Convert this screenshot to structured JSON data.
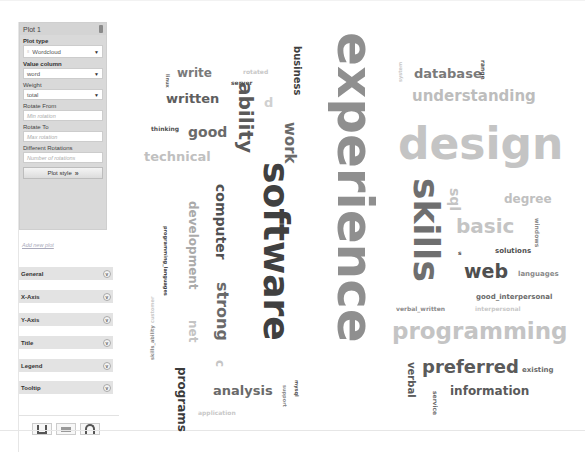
{
  "sidebar": {
    "plot_panel": {
      "title": "Plot 1",
      "plot_type_label": "Plot type",
      "plot_type_value": "Wordcloud",
      "value_column_label": "Value column",
      "value_column_value": "word",
      "weight_label": "Weight",
      "weight_value": "total",
      "rotate_from_label": "Rotate From",
      "rotate_from_placeholder": "Min rotation",
      "rotate_to_label": "Rotate To",
      "rotate_to_placeholder": "Max rotation",
      "different_rotations_label": "Different Rotations",
      "different_rotations_placeholder": "Number of rotations",
      "plot_style_label": "Plot style"
    },
    "add_plot_label": "Add new plot",
    "sections": [
      {
        "label": "General"
      },
      {
        "label": "X-Axis"
      },
      {
        "label": "Y-Axis"
      },
      {
        "label": "Title"
      },
      {
        "label": "Legend"
      },
      {
        "label": "Tooltip"
      }
    ],
    "toolbar": {
      "save_icon": "save-icon",
      "csv_icon": "csv-icon",
      "refresh_icon": "refresh-icon"
    }
  },
  "chart_data": {
    "type": "wordcloud",
    "title": "",
    "words": [
      {
        "text": "experience",
        "x": 200,
        "y": 22,
        "size": 50,
        "color": "#8f8f8f",
        "rot": 90
      },
      {
        "text": "software",
        "x": 128,
        "y": 152,
        "size": 36,
        "color": "#404040",
        "rot": 90
      },
      {
        "text": "design",
        "x": 268,
        "y": 112,
        "size": 44,
        "color": "#c4c4c4",
        "rot": 0
      },
      {
        "text": "skills",
        "x": 278,
        "y": 168,
        "size": 36,
        "color": "#6f6f6f",
        "rot": 90
      },
      {
        "text": "programming",
        "x": 262,
        "y": 310,
        "size": 23,
        "color": "#c4c4c4",
        "rot": 0
      },
      {
        "text": "ability",
        "x": 106,
        "y": 72,
        "size": 20,
        "color": "#5a5a5a",
        "rot": 90
      },
      {
        "text": "understanding",
        "x": 282,
        "y": 79,
        "size": 15,
        "color": "#bdbdbd",
        "rot": 0
      },
      {
        "text": "database",
        "x": 284,
        "y": 57,
        "size": 13,
        "color": "#7a7a7a",
        "rot": 0
      },
      {
        "text": "basic",
        "x": 326,
        "y": 206,
        "size": 20,
        "color": "#c4c4c4",
        "rot": 0
      },
      {
        "text": "web",
        "x": 334,
        "y": 252,
        "size": 19,
        "color": "#4f4f4f",
        "rot": 0
      },
      {
        "text": "preferred",
        "x": 292,
        "y": 348,
        "size": 18,
        "color": "#5a5a5a",
        "rot": 0
      },
      {
        "text": "information",
        "x": 320,
        "y": 375,
        "size": 12,
        "color": "#5a5a5a",
        "rot": 0
      },
      {
        "text": "written",
        "x": 36,
        "y": 82,
        "size": 13,
        "color": "#5e5e5e",
        "rot": 0
      },
      {
        "text": "write",
        "x": 47,
        "y": 57,
        "size": 12,
        "color": "#7a7a7a",
        "rot": 0
      },
      {
        "text": "good",
        "x": 58,
        "y": 115,
        "size": 14,
        "color": "#6a6a6a",
        "rot": 0
      },
      {
        "text": "technical",
        "x": 14,
        "y": 140,
        "size": 13,
        "color": "#c0c0c0",
        "rot": 0
      },
      {
        "text": "work",
        "x": 152,
        "y": 112,
        "size": 15,
        "color": "#6a6a6a",
        "rot": 90
      },
      {
        "text": "business",
        "x": 162,
        "y": 36,
        "size": 10,
        "color": "#404040",
        "rot": 90
      },
      {
        "text": "computer",
        "x": 84,
        "y": 174,
        "size": 14,
        "color": "#505050",
        "rot": 90
      },
      {
        "text": "strong",
        "x": 84,
        "y": 272,
        "size": 16,
        "color": "#6a6a6a",
        "rot": 90
      },
      {
        "text": "development",
        "x": 57,
        "y": 191,
        "size": 12,
        "color": "#aaaaaa",
        "rot": 90
      },
      {
        "text": "programs",
        "x": 46,
        "y": 357,
        "size": 12,
        "color": "#3a3a3a",
        "rot": 90
      },
      {
        "text": "analysis",
        "x": 83,
        "y": 374,
        "size": 13,
        "color": "#6a6a6a",
        "rot": 0
      },
      {
        "text": "net",
        "x": 57,
        "y": 310,
        "size": 12,
        "color": "#c4c4c4",
        "rot": 90
      },
      {
        "text": "c",
        "x": 84,
        "y": 350,
        "size": 12,
        "color": "#c4c4c4",
        "rot": 90
      },
      {
        "text": "d",
        "x": 134,
        "y": 86,
        "size": 13,
        "color": "#d0d0d0",
        "rot": 0
      },
      {
        "text": "thinking",
        "x": 21,
        "y": 116,
        "size": 6,
        "color": "#505050",
        "rot": 0
      },
      {
        "text": "server",
        "x": 101,
        "y": 70,
        "size": 6,
        "color": "#505050",
        "rot": 0
      },
      {
        "text": "rotated",
        "x": 113,
        "y": 59,
        "size": 6,
        "color": "#c8c8c8",
        "rot": 0
      },
      {
        "text": "linux",
        "x": 35,
        "y": 64,
        "size": 5,
        "color": "#666666",
        "rot": 90
      },
      {
        "text": "programming_languages",
        "x": 33,
        "y": 216,
        "size": 5,
        "color": "#404040",
        "rot": 90
      },
      {
        "text": "skills_ability",
        "x": 20,
        "y": 350,
        "size": 5,
        "color": "#8a8a8a",
        "rot": 270
      },
      {
        "text": "customer",
        "x": 20,
        "y": 313,
        "size": 5,
        "color": "#c8c8c8",
        "rot": 270
      },
      {
        "text": "application",
        "x": 68,
        "y": 400,
        "size": 6,
        "color": "#c8c8c8",
        "rot": 0
      },
      {
        "text": "support",
        "x": 152,
        "y": 375,
        "size": 5,
        "color": "#8a8a8a",
        "rot": 90
      },
      {
        "text": "mysql",
        "x": 164,
        "y": 370,
        "size": 5,
        "color": "#505050",
        "rot": 90
      },
      {
        "text": "system",
        "x": 268,
        "y": 72,
        "size": 5,
        "color": "#c8c8c8",
        "rot": 270
      },
      {
        "text": "range",
        "x": 350,
        "y": 50,
        "size": 6,
        "color": "#505050",
        "rot": 90
      },
      {
        "text": "sql",
        "x": 318,
        "y": 178,
        "size": 14,
        "color": "#c4c4c4",
        "rot": 90
      },
      {
        "text": "degree",
        "x": 374,
        "y": 183,
        "size": 12,
        "color": "#c0c0c0",
        "rot": 0
      },
      {
        "text": "windows",
        "x": 404,
        "y": 208,
        "size": 6,
        "color": "#8a8a8a",
        "rot": 90
      },
      {
        "text": "s",
        "x": 328,
        "y": 240,
        "size": 6,
        "color": "#505050",
        "rot": 0
      },
      {
        "text": "solutions",
        "x": 365,
        "y": 238,
        "size": 7,
        "color": "#505050",
        "rot": 0
      },
      {
        "text": "languages",
        "x": 388,
        "y": 261,
        "size": 7,
        "color": "#8a8a8a",
        "rot": 0
      },
      {
        "text": "good_interpersonal",
        "x": 346,
        "y": 284,
        "size": 7,
        "color": "#6a6a6a",
        "rot": 0
      },
      {
        "text": "verbal_written",
        "x": 266,
        "y": 296,
        "size": 6,
        "color": "#8a8a8a",
        "rot": 0
      },
      {
        "text": "interpersonal",
        "x": 345,
        "y": 296,
        "size": 6,
        "color": "#c8c8c8",
        "rot": 0
      },
      {
        "text": "existing",
        "x": 392,
        "y": 357,
        "size": 7,
        "color": "#6a6a6a",
        "rot": 0
      },
      {
        "text": "verbal",
        "x": 276,
        "y": 352,
        "size": 10,
        "color": "#5a5a5a",
        "rot": 90
      },
      {
        "text": "service",
        "x": 302,
        "y": 381,
        "size": 6,
        "color": "#6a6a6a",
        "rot": 90
      }
    ]
  }
}
